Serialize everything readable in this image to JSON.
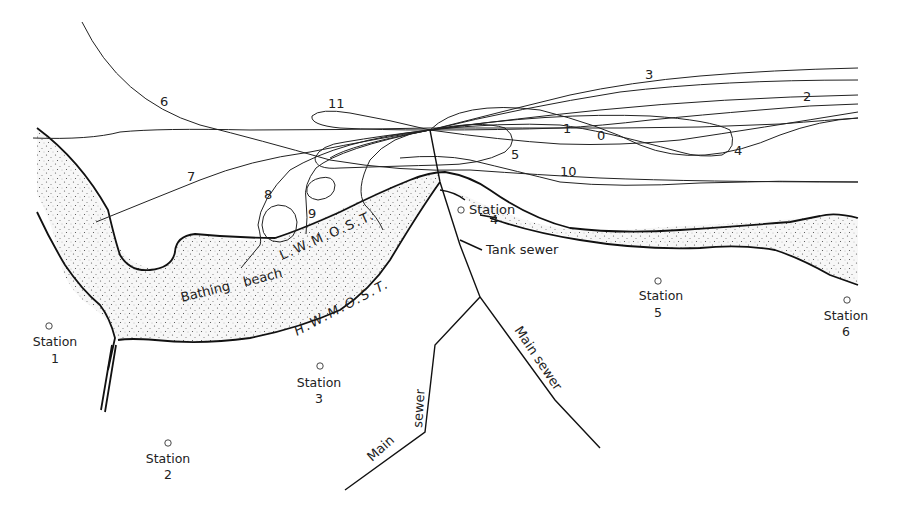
{
  "diagram": {
    "type": "map-sketch",
    "colors": {
      "ink": "#222222",
      "sand_fill": "#f4f4f4",
      "background": "#ffffff"
    },
    "track_labels": [
      "0",
      "1",
      "2",
      "3",
      "4",
      "5",
      "6",
      "7",
      "8",
      "9",
      "10",
      "11"
    ],
    "shore_labels": {
      "low_water": "L.W.M.O.S.T.",
      "high_water": "H.W.M.O.S.T.",
      "beach": "Bathing beach"
    },
    "sewer_labels": {
      "tank": "Tank sewer",
      "main_right": "Main sewer",
      "main_left_1": "Main",
      "main_left_2": "sewer"
    },
    "stations": [
      {
        "name": "Station",
        "number": "1"
      },
      {
        "name": "Station",
        "number": "2"
      },
      {
        "name": "Station",
        "number": "3"
      },
      {
        "name": "Station",
        "number": "4"
      },
      {
        "name": "Station",
        "number": "5"
      },
      {
        "name": "Station",
        "number": "6"
      }
    ]
  }
}
